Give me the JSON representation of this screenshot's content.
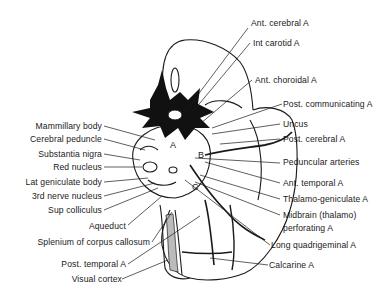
{
  "figure": {
    "region_letters": [
      "A",
      "B",
      "C"
    ]
  },
  "labels_left": [
    {
      "id": "mammillary-body",
      "text": "Mammillary body"
    },
    {
      "id": "cerebral-peduncle",
      "text": "Cerebral peduncle"
    },
    {
      "id": "substantia-nigra",
      "text": "Substantia nigra"
    },
    {
      "id": "red-nucleus",
      "text": "Red nucleus"
    },
    {
      "id": "lat-geniculate-body",
      "text": "Lat geniculate body"
    },
    {
      "id": "3rd-nerve-nucleus",
      "text": "3rd nerve nucleus"
    },
    {
      "id": "sup-colliculus",
      "text": "Sup colliculus"
    },
    {
      "id": "aqueduct",
      "text": "Aqueduct"
    },
    {
      "id": "splenium",
      "text": "Splenium of corpus callosum"
    },
    {
      "id": "post-temporal-a",
      "text": "Post. temporal A"
    },
    {
      "id": "visual-cortex",
      "text": "Visual cortex"
    }
  ],
  "labels_right": [
    {
      "id": "ant-cerebral-a",
      "text": "Ant. cerebral A"
    },
    {
      "id": "int-carotid-a",
      "text": "Int carotid A"
    },
    {
      "id": "ant-choroidal-a",
      "text": "Ant. choroidal A"
    },
    {
      "id": "post-communicating-a",
      "text": "Post. communicating A"
    },
    {
      "id": "uncus",
      "text": "Uncus"
    },
    {
      "id": "post-cerebral-a",
      "text": "Post. cerebral A"
    },
    {
      "id": "peduncular-arteries",
      "text": "Peduncular arteries"
    },
    {
      "id": "ant-temporal-a",
      "text": "Ant. temporal A"
    },
    {
      "id": "thalamo-geniculate-a",
      "text": "Thalamo-geniculate A"
    },
    {
      "id": "midbrain-perforating-a-line1",
      "text": "Midbrain (thalamo)"
    },
    {
      "id": "midbrain-perforating-a-line2",
      "text": "perforating A"
    },
    {
      "id": "long-quadrigeminal-a",
      "text": "Long quadrigeminal A"
    },
    {
      "id": "calcarine-a",
      "text": "Calcarine A"
    }
  ]
}
